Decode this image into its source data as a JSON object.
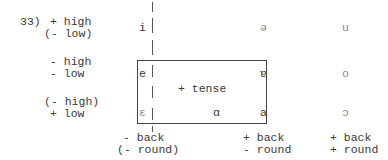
{
  "example_number": "33)",
  "rows": [
    {
      "line1": "+ high",
      "line2": "(- low)",
      "front": "i",
      "central": "ə",
      "back": "u"
    },
    {
      "line1": "- high",
      "line2": "- low",
      "front": "e",
      "central": "ɐ",
      "back": "o"
    },
    {
      "line1": "(- high)",
      "line2": "+ low",
      "front": "ɛ",
      "central": "a",
      "back": "ɔ",
      "box_vowel": "α"
    }
  ],
  "box_label": "+ tense",
  "columns": [
    {
      "line1": "- back",
      "line2": "(- round)"
    },
    {
      "line1": "+ back",
      "line2": "- round"
    },
    {
      "line1": "+ back",
      "line2": "+ round"
    }
  ]
}
